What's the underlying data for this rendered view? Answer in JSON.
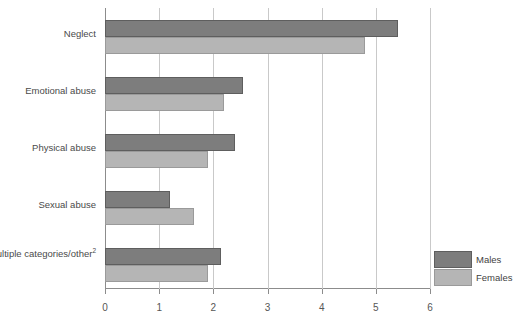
{
  "chart_data": {
    "type": "bar",
    "orientation": "horizontal",
    "title": "",
    "subtitle": "",
    "xlabel": "",
    "ylabel": "",
    "xlim": [
      0,
      6
    ],
    "xticks": [
      "0",
      "1",
      "2",
      "3",
      "4",
      "5",
      "6"
    ],
    "grid": true,
    "grid_axis": "x",
    "legend_position": "bottom-right",
    "categories": [
      "Neglect",
      "Emotional abuse",
      "Physical abuse",
      "Sexual abuse",
      "Multiple categories/other"
    ],
    "category_footnotes": [
      "",
      "",
      "",
      "",
      "2"
    ],
    "series": [
      {
        "name": "Males",
        "color": "#7d7d7d",
        "values": [
          5.4,
          2.55,
          2.4,
          1.2,
          2.15
        ]
      },
      {
        "name": "Females",
        "color": "#b5b5b5",
        "values": [
          4.8,
          2.2,
          1.9,
          1.65,
          1.9
        ]
      }
    ]
  },
  "legend": {
    "items": [
      {
        "label": "Males",
        "color": "#7d7d7d"
      },
      {
        "label": "Females",
        "color": "#b5b5b5"
      }
    ]
  },
  "colors": {
    "males": "#7d7d7d",
    "females": "#b5b5b5",
    "axis": "#8c8c8c",
    "gridline": "#c9c9c9",
    "text": "#4a4a4a",
    "background": "#ffffff"
  }
}
